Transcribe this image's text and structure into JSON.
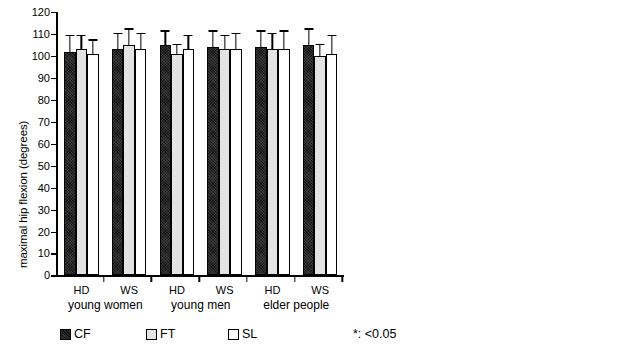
{
  "chart_data": [
    {
      "id": "hip",
      "type": "bar",
      "title": "",
      "xlabel": "",
      "ylabel": "maximal hip flexion (degrees)",
      "ylim": [
        0,
        120
      ],
      "ytick_step": 10,
      "yticks": [
        0,
        10,
        20,
        30,
        40,
        50,
        60,
        70,
        80,
        90,
        100,
        110,
        120
      ],
      "grid": false,
      "legend_position": "below-left",
      "error_bars": "upper-only-sd",
      "categories": [
        "HD",
        "WS",
        "HD",
        "WS",
        "HD",
        "WS"
      ],
      "group_labels": [
        "young women",
        "young men",
        "elder people"
      ],
      "series": [
        {
          "name": "CF",
          "color": "#141414",
          "values": [
            102,
            103,
            105,
            104,
            104,
            105
          ],
          "errors": [
            7,
            7,
            6,
            7,
            7,
            7
          ]
        },
        {
          "name": "FT",
          "color": "#e3e3e3",
          "values": [
            103,
            105,
            101,
            103,
            103,
            100
          ],
          "errors": [
            6,
            7,
            4,
            6,
            7,
            5
          ]
        },
        {
          "name": "SL",
          "color": "#ffffff",
          "values": [
            101,
            103,
            103,
            103,
            103,
            101
          ],
          "errors": [
            6,
            7,
            6,
            7,
            8,
            8
          ]
        }
      ]
    },
    {
      "id": "knee",
      "type": "bar",
      "title": "",
      "xlabel": "",
      "ylabel": "maximal knee flexion (degrees)",
      "ylim": [
        0,
        110
      ],
      "ytick_step": 10,
      "yticks": [
        0,
        10,
        20,
        30,
        40,
        50,
        60,
        70,
        80,
        90,
        100,
        110
      ],
      "grid": false,
      "legend_position": "below-left",
      "error_bars": "upper-only-sd",
      "cropped_at_right_edge": true,
      "categories": [
        "HD",
        "WS"
      ],
      "group_labels": [
        "young women"
      ],
      "series": [
        {
          "name": "CF",
          "color": "#141414",
          "values": [
            95,
            92
          ],
          "errors": [
            5,
            4
          ]
        },
        {
          "name": "FT",
          "color": "#e3e3e3",
          "values": [
            91,
            90
          ],
          "errors": [
            5,
            4
          ]
        },
        {
          "name": "SL",
          "color": "#ffffff",
          "values": [
            91,
            90
          ],
          "errors": [
            5,
            4
          ]
        }
      ]
    }
  ],
  "hip_panel": {
    "y_axis_title": "maximal hip flexion (degrees)",
    "tick_labels": [
      "120",
      "110",
      "100",
      "90",
      "80",
      "70",
      "60",
      "50",
      "40",
      "30",
      "20",
      "10",
      "0"
    ],
    "category_labels": [
      "HD",
      "WS",
      "HD",
      "WS",
      "HD",
      "WS"
    ],
    "group_labels": [
      "young women",
      "young men",
      "elder people"
    ],
    "legend": [
      {
        "label": "CF",
        "swatch": "cf"
      },
      {
        "label": "FT",
        "swatch": "ft"
      },
      {
        "label": "SL",
        "swatch": "sl"
      }
    ],
    "significance_note": "*: <0.05"
  },
  "knee_panel": {
    "y_axis_title": "maximal knee flexion (degrees)",
    "tick_labels": [
      "110",
      "100",
      "90",
      "80",
      "70",
      "60",
      "50",
      "40",
      "30",
      "20",
      "10",
      "0"
    ],
    "category_labels": [
      "HD",
      "WS"
    ],
    "group_labels": [
      "young women"
    ],
    "legend": [
      {
        "label": "CF",
        "swatch": "cf"
      },
      {
        "label": "",
        "swatch": "ft"
      }
    ]
  }
}
